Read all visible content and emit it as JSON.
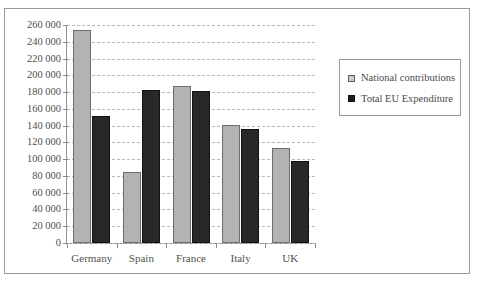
{
  "chart_data": {
    "type": "bar",
    "title": "",
    "xlabel": "",
    "ylabel": "",
    "categories": [
      "Germany",
      "Spain",
      "France",
      "Italy",
      "UK"
    ],
    "series": [
      {
        "name": "National contributions",
        "color": "#b3b3b3",
        "values": [
          254000,
          85000,
          187000,
          141000,
          113000
        ]
      },
      {
        "name": "Total EU Expenditure",
        "color": "#282828",
        "values": [
          151000,
          183000,
          181000,
          136000,
          98000
        ]
      }
    ],
    "ylim": [
      0,
      260000
    ],
    "ytick_values": [
      0,
      20000,
      40000,
      60000,
      80000,
      100000,
      120000,
      140000,
      160000,
      180000,
      200000,
      220000,
      240000,
      260000
    ],
    "ytick_labels": [
      "0",
      "20 000",
      "40 000",
      "60 000",
      "80 000",
      "100 000",
      "120 000",
      "140 000",
      "160 000",
      "180 000",
      "200 000",
      "220 000",
      "240 000",
      "260 000"
    ],
    "grid": true,
    "grid_style": "dashed-horizontal",
    "legend_position": "right"
  }
}
